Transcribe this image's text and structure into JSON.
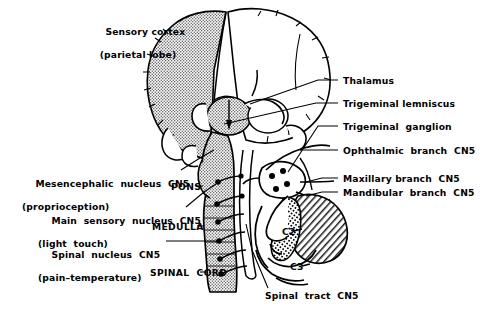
{
  "figure": {
    "domain": "Diagram",
    "width": 480,
    "height": 318,
    "background_color": "#ffffff",
    "ink_color": "#000000",
    "shading_color": "#8c8c8c"
  },
  "labels": {
    "sensory_cortex": {
      "line1": "Sensory cortex",
      "line2": "(parietal lobe)"
    },
    "thalamus": "Thalamus",
    "trigeminal_lemniscus": "Trigeminal lemniscus",
    "trigeminal_ganglion": "Trigeminal  ganglion",
    "ophthalmic_branch": "Ophthalmic  branch  CN5",
    "maxillary_branch": "Maxillary branch  CN5",
    "mandibular_branch": "Mandibular  branch  CN5",
    "mesencephalic_nucleus": {
      "line1": "Mesencephalic  nucleus  CN5",
      "line2": "(proprioception)"
    },
    "main_sensory_nucleus": {
      "line1": "Main  sensory  nucleus  CN5",
      "line2": "(light  touch)"
    },
    "spinal_nucleus": {
      "line1": "Spinal  nucleus  CN5",
      "line2": "(pain–temperature)"
    },
    "spinal_tract": "Spinal  tract  CN5",
    "pons": "PONS",
    "medulla": "MEDULLA",
    "spinal_cord": "SPINAL  CORD",
    "c2": "C2",
    "c3": "C3"
  }
}
